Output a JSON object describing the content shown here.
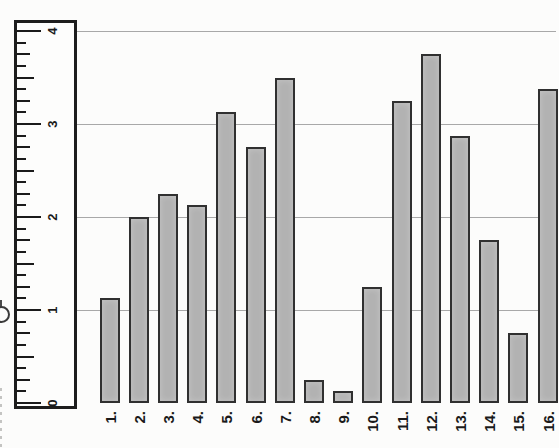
{
  "chart_data": {
    "type": "bar",
    "title": "",
    "categories": [
      "1.",
      "2.",
      "3.",
      "4.",
      "5.",
      "6.",
      "7.",
      "8.",
      "9.",
      "10.",
      "11.",
      "12.",
      "13.",
      "14.",
      "15.",
      "16."
    ],
    "values": [
      1.125,
      2.0,
      2.25,
      2.125,
      3.125,
      2.75,
      3.5,
      0.25,
      0.125,
      1.25,
      3.25,
      3.75,
      2.875,
      1.75,
      0.75,
      3.375
    ],
    "xlabel": "",
    "ylabel": "",
    "ylim": [
      0,
      4
    ],
    "ytick_labels": [
      "0",
      "1",
      "2",
      "3",
      "4"
    ],
    "ytick_values": [
      0,
      1,
      2,
      3,
      4
    ],
    "minor_tick_step": 0.125,
    "grid": "horizontal gridlines at 1, 2, 3, 4",
    "legend": "none",
    "axis_style": "ruler-shaped value axis with eighth-unit tick marks, numerals rotated 90deg",
    "label_rotation": "text rotated -90deg, reads bottom to top"
  },
  "colors": {
    "paper": "#fcfcfb",
    "bar_fill": "#b2b2b2",
    "bar_border": "#303030",
    "gridline": "#a8a8a8",
    "ruler_border": "#1d1d1d",
    "text": "#1a1a1a"
  }
}
